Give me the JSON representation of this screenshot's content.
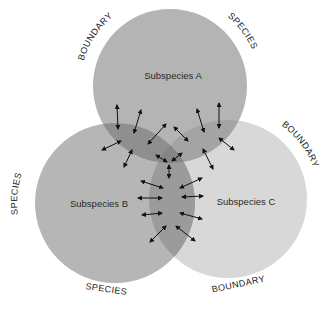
{
  "diagram": {
    "type": "three-circle-venn",
    "colors": {
      "circle_a": "#b4b4b4",
      "circle_b": "#b6b6b6",
      "circle_c": "#d8d8d8",
      "overlap_ab": "#8f8f8f",
      "overlap_ac": "#a4a4a4",
      "overlap_bc": "#9b9b9b",
      "overlap_abc": "#858585",
      "arrow": "#111111",
      "text": "#222222"
    },
    "circles": [
      {
        "id": "a",
        "label": "Subspecies A",
        "cx": 170,
        "cy": 86,
        "r": 77
      },
      {
        "id": "b",
        "label": "Subspecies B",
        "cx": 115,
        "cy": 203,
        "r": 80
      },
      {
        "id": "c",
        "label": "Subspecies C",
        "cx": 228,
        "cy": 199,
        "r": 79
      }
    ],
    "outer_labels": [
      {
        "text": "BOUNDARY",
        "position": "top-left of Subspecies A"
      },
      {
        "text": "SPECIES",
        "position": "top-right of Subspecies A"
      },
      {
        "text": "SPECIES",
        "position": "left of Subspecies B"
      },
      {
        "text": "SPECIES",
        "position": "bottom of Subspecies B"
      },
      {
        "text": "BOUNDARY",
        "position": "right of Subspecies C"
      },
      {
        "text": "BOUNDARY",
        "position": "bottom of Subspecies C"
      }
    ],
    "arrow_annotation": "double-headed arrows indicate gene flow across overlapping zones"
  }
}
